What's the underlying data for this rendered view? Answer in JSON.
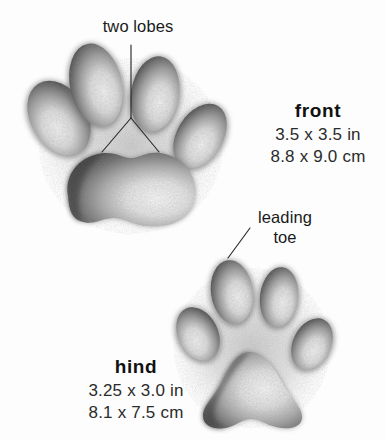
{
  "figure": {
    "kind": "animal-track-illustration",
    "background_color": "#fdfdfd",
    "ink_color": "#1a1a1a"
  },
  "callouts": [
    {
      "id": "two-lobes",
      "text": "two lobes",
      "points_to": "front-heel-pad",
      "leader": "vertical-then-fork"
    },
    {
      "id": "leading-toe",
      "line1": "leading",
      "line2": "toe",
      "points_to": "hind-leading-toe",
      "leader": "diagonal"
    }
  ],
  "tracks": [
    {
      "id": "front",
      "name": "front",
      "size_in": "3.5 x 3.5 in",
      "size_cm": "8.8 x 9.0 cm",
      "toe_count": 4
    },
    {
      "id": "hind",
      "name": "hind",
      "size_in": "3.25 x 3.0 in",
      "size_cm": "8.1 x 7.5 cm",
      "toe_count": 4
    }
  ]
}
